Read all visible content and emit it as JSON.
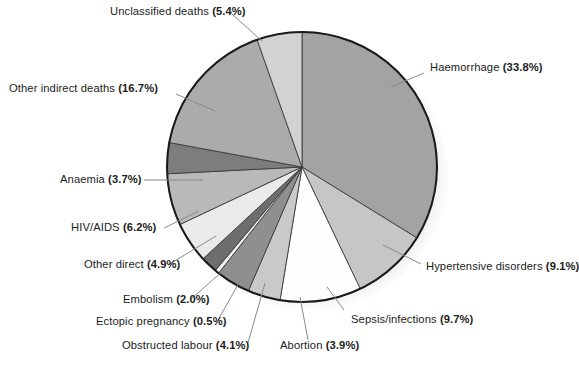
{
  "figure": {
    "background_color": "#ffffff",
    "footnote": ""
  },
  "chart_data": {
    "type": "pie",
    "title": "",
    "subtitle": "",
    "xlabel": "",
    "ylabel": "",
    "legend_position": "callout-labels",
    "grid": false,
    "units": "percent",
    "start_angle_deg": 0,
    "direction": "clockwise",
    "center": {
      "cx": 302,
      "cy": 167
    },
    "radius": 135,
    "total": 100.0,
    "categories": [
      "Haemorrhage",
      "Hypertensive disorders",
      "Sepsis/infections",
      "Abortion",
      "Obstructed labour",
      "Ectopic pregnancy",
      "Embolism",
      "Other direct",
      "HIV/AIDS",
      "Anaemia",
      "Other indirect deaths",
      "Unclassified deaths"
    ],
    "values": [
      33.8,
      9.1,
      9.7,
      3.9,
      4.1,
      0.5,
      2.0,
      4.9,
      6.2,
      3.7,
      16.7,
      5.4
    ],
    "colors": [
      "#a3a3a3",
      "#c6c6c6",
      "#fdfdfd",
      "#c9c9c9",
      "#9d9d9d",
      "#efefef",
      "#6f6f6f",
      "#e8e8e8",
      "#f3f3f3",
      "#c4c4c4",
      "#8d8d8d",
      "#b5b5b5",
      "#d3d3d3"
    ],
    "slices": [
      {
        "label": "Haemorrhage",
        "value": 33.8,
        "display": "Haemorrhage (33.8%)",
        "color": "#a3a3a3"
      },
      {
        "label": "Hypertensive disorders",
        "value": 9.1,
        "display": "Hypertensive disorders (9.1%)",
        "color": "#c6c6c6"
      },
      {
        "label": "Sepsis/infections",
        "value": 9.7,
        "display": "Sepsis/infections (9.7%)",
        "color": "#fefefe"
      },
      {
        "label": "Abortion",
        "value": 3.9,
        "display": "Abortion (3.9%)",
        "color": "#c9c9c9"
      },
      {
        "label": "Obstructed labour",
        "value": 4.1,
        "display": "Obstructed labour (4.1%)",
        "color": "#8f8f8f"
      },
      {
        "label": "Ectopic pregnancy",
        "value": 0.5,
        "display": "Ectopic pregnancy (0.5%)",
        "color": "#f2f2f2"
      },
      {
        "label": "Embolism",
        "value": 2.0,
        "display": "Embolism (2.0%)",
        "color": "#6e6e6e"
      },
      {
        "label": "Other direct",
        "value": 4.9,
        "display": "Other direct (4.9%)",
        "color": "#eaeaea"
      },
      {
        "label": "HIV/AIDS",
        "value": 6.2,
        "display": "HIV/AIDS (6.2%)",
        "color": "#b9b9b9"
      },
      {
        "label": "Anaemia",
        "value": 3.7,
        "display": "Anaemia (3.7%)",
        "color": "#7d7d7d"
      },
      {
        "label": "Other indirect deaths",
        "value": 16.7,
        "display": "Other indirect deaths (16.7%)",
        "color": "#ababab"
      },
      {
        "label": "Unclassified deaths",
        "value": 5.4,
        "display": "Unclassified deaths (5.4%)",
        "color": "#d2d2d2"
      }
    ]
  },
  "labels": {
    "unclassified_deaths": {
      "name": "Unclassified deaths",
      "pct": "(5.4%)"
    },
    "haemorrhage": {
      "name": "Haemorrhage",
      "pct": "(33.8%)"
    },
    "other_indirect_deaths": {
      "name": "Other indirect deaths",
      "pct": "(16.7%)"
    },
    "anaemia": {
      "name": "Anaemia",
      "pct": "(3.7%)"
    },
    "hiv_aids": {
      "name": "HIV/AIDS",
      "pct": "(6.2%)"
    },
    "other_direct": {
      "name": "Other direct",
      "pct": "(4.9%)"
    },
    "embolism": {
      "name": "Embolism",
      "pct": "(2.0%)"
    },
    "ectopic_pregnancy": {
      "name": "Ectopic pregnancy",
      "pct": "(0.5%)"
    },
    "obstructed_labour": {
      "name": "Obstructed labour",
      "pct": "(4.1%)"
    },
    "abortion": {
      "name": "Abortion",
      "pct": "(3.9%)"
    },
    "sepsis_infections": {
      "name": "Sepsis/infections",
      "pct": "(9.7%)"
    },
    "hypertensive_disorders": {
      "name": "Hypertensive disorders",
      "pct": "(9.1%)"
    }
  }
}
